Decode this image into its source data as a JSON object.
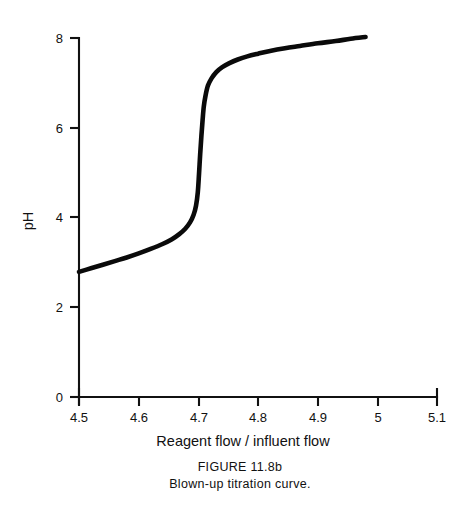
{
  "figure": {
    "caption_title": "FIGURE 11.8b",
    "caption_subtitle": "Blown-up titration curve."
  },
  "chart_data": {
    "type": "line",
    "title": "",
    "subtitle": "",
    "xlabel": "Reagent flow / influent flow",
    "ylabel": "pH",
    "xlim": [
      4.5,
      5.1
    ],
    "ylim": [
      0,
      8
    ],
    "grid": false,
    "legend": false,
    "legend_position": "none",
    "xticks": [
      4.5,
      4.6,
      4.7,
      4.8,
      4.9,
      5.0,
      5.1
    ],
    "xticklabels": [
      "4.5",
      "4.6",
      "4.7",
      "4.8",
      "4.9",
      "5",
      "5.1"
    ],
    "yticks": [
      0,
      2,
      4,
      6,
      8
    ],
    "yticklabels": [
      "0",
      "2",
      "4",
      "6",
      "8"
    ],
    "series": [
      {
        "name": "titration curve",
        "color": "#0a0a0a",
        "linewidth": 4.6,
        "x": [
          4.5,
          4.52,
          4.54,
          4.56,
          4.58,
          4.6,
          4.62,
          4.64,
          4.655,
          4.668,
          4.678,
          4.686,
          4.692,
          4.696,
          4.699,
          4.701,
          4.703,
          4.705,
          4.707,
          4.709,
          4.712,
          4.716,
          4.722,
          4.73,
          4.74,
          4.752,
          4.766,
          4.782,
          4.8,
          4.82,
          4.845,
          4.87,
          4.9,
          4.93,
          4.955,
          4.98
        ],
        "y": [
          2.78,
          2.86,
          2.94,
          3.02,
          3.1,
          3.19,
          3.29,
          3.4,
          3.5,
          3.62,
          3.74,
          3.88,
          4.05,
          4.25,
          4.55,
          4.95,
          5.4,
          5.8,
          6.15,
          6.45,
          6.7,
          6.92,
          7.08,
          7.22,
          7.33,
          7.42,
          7.5,
          7.57,
          7.63,
          7.69,
          7.75,
          7.8,
          7.86,
          7.91,
          7.96,
          8.0
        ]
      }
    ]
  },
  "axes_geometry": {
    "origin_px": [
      79,
      397
    ],
    "x_px_per_unit": 597,
    "y_px_per_unit": 45
  }
}
